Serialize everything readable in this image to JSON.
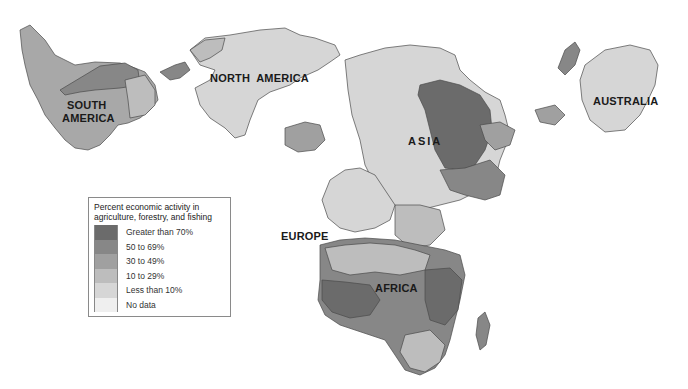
{
  "map": {
    "title": "Percent economic activity in agriculture, forestry, and fishing",
    "region_labels": [
      {
        "id": "south-america",
        "text_lines": [
          "SOUTH",
          "AMERICA"
        ]
      },
      {
        "id": "north-america",
        "text": "NORTH  AMERICA"
      },
      {
        "id": "asia",
        "text": "ASIA"
      },
      {
        "id": "australia",
        "text": "AUSTRALIA"
      },
      {
        "id": "europe",
        "text": "EUROPE"
      },
      {
        "id": "africa",
        "text": "AFRICA"
      }
    ],
    "colors": {
      "gt70": "#6b6b6b",
      "50to69": "#878787",
      "30to49": "#a0a0a0",
      "10to29": "#bdbdbd",
      "lt10": "#d6d6d6",
      "nodata": "#efefef",
      "border": "#4a4a4a"
    }
  },
  "legend": {
    "title_line1": "Percent economic activity in",
    "title_line2": "agriculture, forestry, and fishing",
    "items": [
      {
        "label": "Greater than 70%",
        "color": "#6b6b6b"
      },
      {
        "label": "50 to 69%",
        "color": "#878787"
      },
      {
        "label": "30 to 49%",
        "color": "#a0a0a0"
      },
      {
        "label": "10 to 29%",
        "color": "#bdbdbd"
      },
      {
        "label": "Less than 10%",
        "color": "#d6d6d6"
      },
      {
        "label": "No data",
        "color": "#efefef"
      }
    ]
  }
}
